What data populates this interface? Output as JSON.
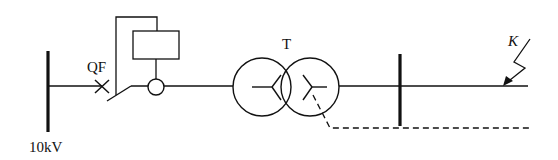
{
  "diagram": {
    "type": "single-line electrical diagram",
    "labels": {
      "source_bus": "10kV",
      "breaker": "QF",
      "transformer": "T",
      "fault": "K"
    },
    "components": [
      {
        "name": "source-busbar",
        "label": "10kV"
      },
      {
        "name": "circuit-breaker",
        "label": "QF"
      },
      {
        "name": "protection-relay",
        "label": ""
      },
      {
        "name": "current-transformer",
        "label": ""
      },
      {
        "name": "power-transformer",
        "label": "T"
      },
      {
        "name": "load-busbar",
        "label": ""
      },
      {
        "name": "fault-point",
        "label": "K"
      }
    ],
    "colors": {
      "line": "#111111",
      "background": "#ffffff"
    }
  }
}
